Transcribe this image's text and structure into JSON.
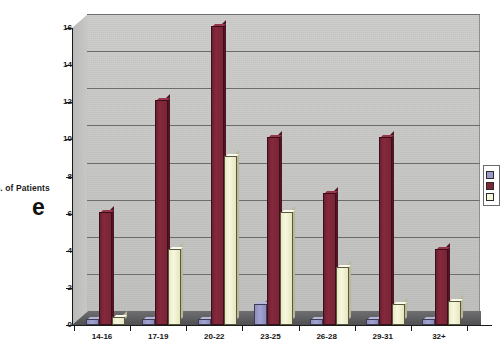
{
  "chart_data": {
    "type": "bar",
    "title": "",
    "xlabel": "",
    "ylabel": "No. of Patients",
    "ylabel_clipped": "o. of Patients",
    "categories": [
      "14-16",
      "17-19",
      "20-22",
      "23-25",
      "26-28",
      "29-31",
      "32+"
    ],
    "series": [
      {
        "name": "Series 1",
        "color": "#9a9ac8",
        "values": [
          0.2,
          0.2,
          0.2,
          1.0,
          0.2,
          0.2,
          0.2
        ]
      },
      {
        "name": "Series 2",
        "color": "#7d2638",
        "values": [
          6,
          12,
          16,
          10,
          7,
          10,
          4
        ]
      },
      {
        "name": "Series 3",
        "color": "#f5f5d8",
        "values": [
          0.3,
          4,
          9,
          6,
          3,
          1,
          1.2
        ]
      }
    ],
    "ylim": [
      0,
      16
    ],
    "yticks": [
      0,
      2,
      4,
      6,
      8,
      10,
      12,
      14,
      16
    ],
    "ytick_labels": [
      "0",
      "2",
      "4",
      "6",
      "8",
      "10",
      "12",
      "14",
      "16"
    ],
    "grid": true,
    "legend_position": "right",
    "plot_style": "3d-bar",
    "plot_background": "#c6c6c4",
    "floor_color": "#5c5c5e"
  },
  "annotation": {
    "figure_letter": "e"
  },
  "legend": {
    "entries": [
      {
        "label": "",
        "color": "#9a9ac8"
      },
      {
        "label": "",
        "color": "#7d2638"
      },
      {
        "label": "",
        "color": "#f5f5d8"
      }
    ]
  }
}
